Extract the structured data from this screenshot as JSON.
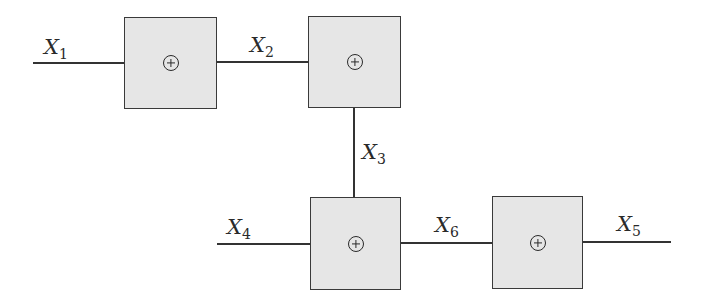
{
  "diagram": {
    "type": "xor-network",
    "nodes": [
      {
        "id": "A",
        "operator": "⊕",
        "name": "xor-gate-1"
      },
      {
        "id": "B",
        "operator": "⊕",
        "name": "xor-gate-2"
      },
      {
        "id": "C",
        "operator": "⊕",
        "name": "xor-gate-3"
      },
      {
        "id": "D",
        "operator": "⊕",
        "name": "xor-gate-4"
      }
    ],
    "edges": [
      {
        "from": "input",
        "to": "A",
        "label": {
          "var": "X",
          "sub": "1"
        }
      },
      {
        "from": "A",
        "to": "B",
        "label": {
          "var": "X",
          "sub": "2"
        }
      },
      {
        "from": "B",
        "to": "C",
        "label": {
          "var": "X",
          "sub": "3"
        }
      },
      {
        "from": "input",
        "to": "C",
        "label": {
          "var": "X",
          "sub": "4"
        }
      },
      {
        "from": "C",
        "to": "D",
        "label": {
          "var": "X",
          "sub": "6"
        }
      },
      {
        "from": "D",
        "to": "output",
        "label": {
          "var": "X",
          "sub": "5"
        }
      }
    ],
    "colors": {
      "box_fill": "#e6e6e6",
      "stroke": "#333333"
    }
  }
}
